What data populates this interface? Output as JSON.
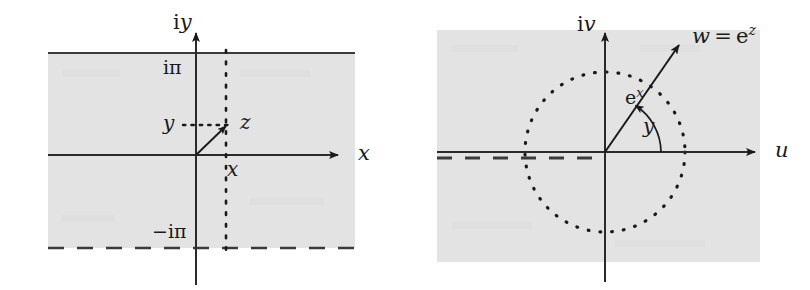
{
  "figure": {
    "background_color": "#ffffff",
    "shade_color": "#e3e3e3",
    "ink_color": "#1a1a1a",
    "ghost_color": "#e8e8e8"
  },
  "left_panel": {
    "name": "z-plane strip",
    "vertical_axis_label": {
      "upright": "i",
      "italic": "y"
    },
    "horizontal_axis_label": "x",
    "upper_boundary_label": {
      "upright": "i",
      "symbol": "π"
    },
    "lower_boundary_label": {
      "sign": "−",
      "upright": "i",
      "symbol": "π"
    },
    "point_label": "z",
    "imaginary_part_label": "y",
    "real_part_label": "x",
    "upper_boundary_style": "solid",
    "lower_boundary_style": "dashed",
    "guide_style": "dotted",
    "geometry": {
      "origin_x": 196,
      "origin_y": 155,
      "shade_left": 48,
      "shade_right": 355,
      "shade_top": 53,
      "shade_bottom": 248,
      "point_x": 228,
      "point_y": 125,
      "axis_arrow_x": 345,
      "axis_top_y": 28,
      "axis_bottom_y": 285
    }
  },
  "right_panel": {
    "name": "w-plane image",
    "vertical_axis_label": {
      "upright": "i",
      "italic": "v"
    },
    "horizontal_axis_label": "u",
    "vector_label": {
      "w": "w",
      "equals": "=",
      "upright_e": "e",
      "exponent": "z"
    },
    "modulus_label": {
      "upright_e": "e",
      "exponent": "x"
    },
    "angle_label": "y",
    "circle_style": "dotted",
    "branch_cut_style": "dashed",
    "geometry": {
      "origin_x": 605,
      "origin_y": 152,
      "shade_left": 437,
      "shade_right": 760,
      "shade_top": 30,
      "shade_bottom": 262,
      "circle_radius": 80,
      "arrow_tip_x": 682,
      "arrow_tip_y": 42,
      "axis_arrow_x": 762,
      "axis_top_y": 28,
      "axis_bottom_y": 282
    }
  },
  "ghost_text": {
    "left": [
      "— —— —",
      "—— ——"
    ],
    "right": [
      "—— —— —",
      "— ——— ——"
    ]
  }
}
